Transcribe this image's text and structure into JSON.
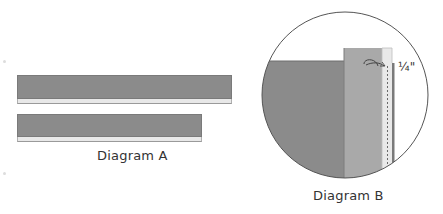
{
  "diagram_a": {
    "caption": "Diagram A",
    "strips": [
      {
        "name": "long-strip",
        "length": "long"
      },
      {
        "name": "short-strip",
        "length": "short"
      }
    ]
  },
  "diagram_b": {
    "caption": "Diagram B",
    "seam_allowance_label": "¼\""
  },
  "colors": {
    "dark_fabric": "#8b8b8b",
    "medium_fabric": "#a9a9a9",
    "light_fabric": "#e8e8e8",
    "outline": "#555555"
  }
}
